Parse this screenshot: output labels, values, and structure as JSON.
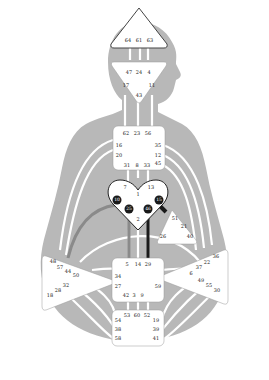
{
  "colors": {
    "background": "#ffffff",
    "silhouette": "#b8b8b8",
    "channel": "#ffffff",
    "center_fill": "#ffffff",
    "center_stroke": "#888888",
    "active_gate": "#1a1a1a",
    "defined_channel_dark": "#1a1a1a",
    "defined_channel_gray": "#8a8a8a"
  },
  "centers": {
    "head": {
      "name": "Head",
      "gates": [
        "64",
        "61",
        "63"
      ]
    },
    "ajna": {
      "name": "Ajna",
      "gates": [
        "47",
        "24",
        "4",
        "17",
        "11",
        "43"
      ]
    },
    "throat": {
      "name": "Throat",
      "gates": [
        "62",
        "23",
        "56",
        "16",
        "35",
        "20",
        "12",
        "45",
        "31",
        "8",
        "33"
      ]
    },
    "g": {
      "name": "G",
      "gates": [
        "7",
        "1",
        "13",
        "10",
        "25",
        "15",
        "46",
        "2"
      ],
      "active_gates": [
        "10",
        "25",
        "15",
        "46"
      ]
    },
    "heart": {
      "name": "Heart",
      "gates": [
        "51",
        "21",
        "26",
        "40"
      ]
    },
    "spleen": {
      "name": "Spleen",
      "gates": [
        "48",
        "57",
        "44",
        "50",
        "32",
        "28",
        "18"
      ]
    },
    "solar_plexus": {
      "name": "Solar Plexus",
      "gates": [
        "36",
        "22",
        "37",
        "6",
        "49",
        "55",
        "30"
      ]
    },
    "sacral": {
      "name": "Sacral",
      "gates": [
        "5",
        "14",
        "29",
        "34",
        "27",
        "59",
        "42",
        "3",
        "9"
      ]
    },
    "root": {
      "name": "Root",
      "gates": [
        "53",
        "60",
        "52",
        "54",
        "19",
        "38",
        "39",
        "58",
        "41"
      ]
    }
  }
}
